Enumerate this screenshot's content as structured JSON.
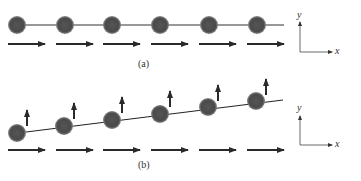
{
  "figure": {
    "panel_a": {
      "label": "(a)",
      "balls": [
        {
          "x": 17,
          "y": 25
        },
        {
          "x": 65,
          "y": 25
        },
        {
          "x": 112,
          "y": 25
        },
        {
          "x": 160,
          "y": 25
        },
        {
          "x": 209,
          "y": 25
        },
        {
          "x": 257,
          "y": 25
        }
      ],
      "axis": {
        "x_label": "x",
        "y_label": "y"
      }
    },
    "panel_b": {
      "label": "(b)",
      "balls": [
        {
          "x": 17,
          "y": 133
        },
        {
          "x": 64,
          "y": 126
        },
        {
          "x": 112,
          "y": 119
        },
        {
          "x": 160,
          "y": 113
        },
        {
          "x": 208,
          "y": 107
        },
        {
          "x": 256,
          "y": 100
        }
      ],
      "axis": {
        "x_label": "x",
        "y_label": "y"
      }
    },
    "colors": {
      "ball": "#5a5a5a",
      "line": "#333333",
      "arrow": "#2a2a2a"
    }
  }
}
